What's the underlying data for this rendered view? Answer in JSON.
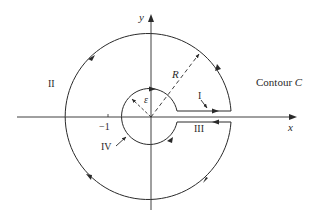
{
  "diagram": {
    "title": "Contour C",
    "axes": {
      "x_label": "x",
      "y_label": "y",
      "tick_label": "−1"
    },
    "radii": {
      "outer": "R",
      "inner": "ε"
    },
    "segments": {
      "upper_line": "I",
      "outer_circle": "II",
      "lower_line": "III",
      "inner_circle": "IV"
    },
    "colors": {
      "stroke": "#2a2a2a",
      "background": "#ffffff"
    }
  }
}
